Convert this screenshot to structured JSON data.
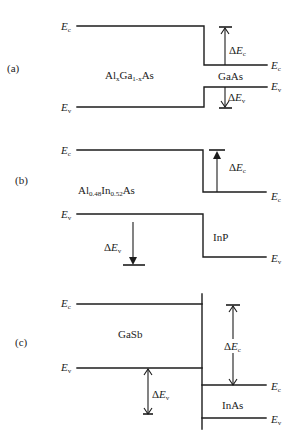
{
  "colors": {
    "line": "#1c1c1c",
    "text": "#222222",
    "background": "#ffffff"
  },
  "labels": {
    "ec": {
      "full": "Ec",
      "main": "E",
      "sub": "c"
    },
    "ev": {
      "full": "Ev",
      "main": "E",
      "sub": "v"
    },
    "delta_ec": {
      "full": "ΔEc",
      "delta": "Δ",
      "main": "E",
      "sub": "c"
    },
    "delta_ev": {
      "full": "ΔEv",
      "delta": "Δ",
      "main": "E",
      "sub": "v"
    }
  },
  "panels": [
    {
      "label": "(a)",
      "left_material": {
        "full": "AlxGa1-xAs",
        "parts": [
          "Al",
          "x",
          "Ga",
          "1-x",
          "As"
        ]
      },
      "right_material": {
        "full": "GaAs"
      }
    },
    {
      "label": "(b)",
      "left_material": {
        "full": "Al0.48In0.52As",
        "parts": [
          "Al",
          "0.48",
          "In",
          "0.52",
          "As"
        ]
      },
      "right_material": {
        "full": "InP"
      }
    },
    {
      "label": "(c)",
      "left_material": {
        "full": "GaSb"
      },
      "right_material": {
        "full": "InAs"
      }
    }
  ]
}
